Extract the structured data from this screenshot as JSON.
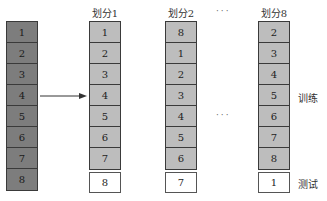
{
  "source_column": {
    "cells": [
      "1",
      "2",
      "3",
      "4",
      "5",
      "6",
      "7",
      "8"
    ]
  },
  "splits": [
    {
      "title": "划分1",
      "train": [
        "1",
        "2",
        "3",
        "4",
        "5",
        "6",
        "7"
      ],
      "test": "8"
    },
    {
      "title": "划分2",
      "train": [
        "8",
        "1",
        "2",
        "3",
        "4",
        "5",
        "6"
      ],
      "test": "7"
    },
    {
      "title": "划分8",
      "train": [
        "2",
        "3",
        "4",
        "5",
        "6",
        "7",
        "8"
      ],
      "test": "1"
    }
  ],
  "ellipsis_top": "···",
  "ellipsis_mid": "···",
  "labels": {
    "train": "训练",
    "test": "测试"
  },
  "colors": {
    "source": "#7d7d7d",
    "train": "#bdbdbd",
    "test": "#ffffff"
  }
}
